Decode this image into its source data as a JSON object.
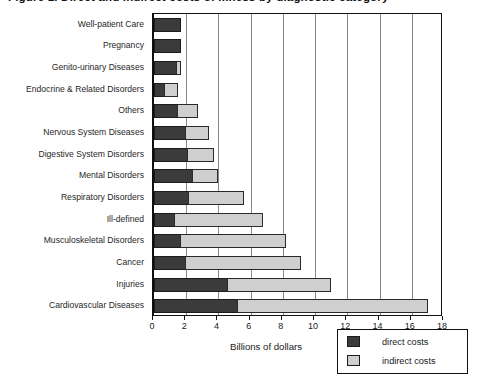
{
  "title": {
    "text": "Figure 1. Direct and indirect costs of illness by diagnostic category"
  },
  "chart_data": {
    "type": "bar",
    "orientation": "horizontal",
    "stacked": true,
    "title": "",
    "xlabel": "Billions of dollars",
    "ylabel": "",
    "xlim": [
      0,
      18
    ],
    "xticks": [
      0,
      2,
      4,
      6,
      8,
      10,
      12,
      14,
      16,
      18
    ],
    "xticklabels": [
      "0",
      "2",
      "4",
      "6",
      "8",
      "10",
      "12",
      "14",
      "16",
      "18"
    ],
    "grid": "vertical",
    "legend_position": "bottom-right",
    "categories": [
      "Well-patient Care",
      "Pregnancy",
      "Genito-urinary Diseases",
      "Endocrine & Related Disorders",
      "Others",
      "Nervous System Diseases",
      "Digestive System Disorders",
      "Mental Disorders",
      "Respiratory Disorders",
      "Ill-defined",
      "Musculoskeletal Disorders",
      "Cancer",
      "Injuries",
      "Cardiovascular Diseases"
    ],
    "series": [
      {
        "name": "direct costs",
        "color": "#3b3b3b",
        "values": [
          1.65,
          1.65,
          1.45,
          0.7,
          1.5,
          2.0,
          2.1,
          2.4,
          2.2,
          1.3,
          1.7,
          2.0,
          4.6,
          5.2
        ]
      },
      {
        "name": "indirect costs",
        "color": "#cfcfcf",
        "values": [
          0.0,
          0.0,
          0.2,
          0.8,
          1.25,
          1.4,
          1.65,
          1.6,
          3.4,
          5.45,
          6.5,
          7.1,
          6.4,
          11.8
        ]
      }
    ],
    "totals": [
      1.65,
      1.65,
      1.65,
      1.5,
      2.75,
      3.4,
      3.75,
      4.0,
      5.6,
      6.75,
      8.2,
      9.1,
      11.0,
      17.0
    ]
  },
  "legend": {
    "items": [
      {
        "label": "direct costs",
        "color": "#3b3b3b"
      },
      {
        "label": "indirect costs",
        "color": "#cfcfcf"
      }
    ]
  }
}
